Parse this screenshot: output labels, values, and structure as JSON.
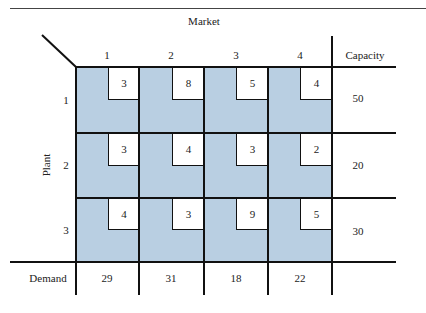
{
  "table": {
    "market_title": "Market",
    "plant_title": "Plant",
    "capacity_title": "Capacity",
    "demand_title": "Demand",
    "markets": [
      "1",
      "2",
      "3",
      "4"
    ],
    "plants": [
      "1",
      "2",
      "3"
    ],
    "costs": [
      [
        "3",
        "8",
        "5",
        "4"
      ],
      [
        "3",
        "4",
        "3",
        "2"
      ],
      [
        "4",
        "3",
        "9",
        "5"
      ]
    ],
    "capacity": [
      "50",
      "20",
      "30"
    ],
    "demand": [
      "29",
      "31",
      "18",
      "22"
    ]
  },
  "colors": {
    "cell_fill": "#b9cfe2",
    "line": "#111111"
  }
}
